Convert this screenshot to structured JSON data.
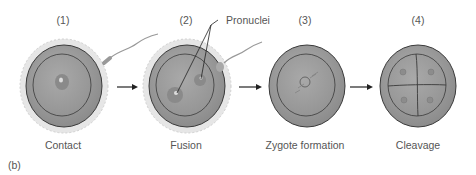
{
  "panel_label": "(b)",
  "stages": [
    {
      "number": "(1)",
      "caption": "Contact"
    },
    {
      "number": "(2)",
      "caption": "Fusion"
    },
    {
      "number": "(3)",
      "caption": "Zygote formation"
    },
    {
      "number": "(4)",
      "caption": "Cleavage"
    }
  ],
  "callout": "Pronuclei",
  "colors": {
    "outer": "#8a8a8a",
    "inner": "#9d9d9d",
    "line": "#3a3a3a",
    "follicle": "#d8d8d8"
  }
}
